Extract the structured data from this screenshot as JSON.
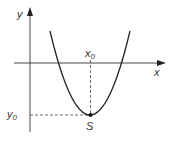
{
  "diagram": {
    "type": "parabola",
    "axes": {
      "x_label": "x",
      "y_label": "y"
    },
    "vertex": {
      "label": "S",
      "x_label_main": "x",
      "x_label_sub": "0",
      "y_label_main": "y",
      "y_label_sub": "0"
    },
    "colors": {
      "stroke": "#222222",
      "text": "#333333"
    }
  }
}
